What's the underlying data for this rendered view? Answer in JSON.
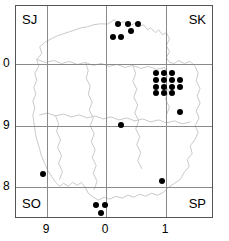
{
  "chart_data": {
    "type": "scatter",
    "title": "",
    "subtitle": "",
    "xlabel": "",
    "ylabel": "",
    "grid": true,
    "legend": null,
    "xlim": [
      8.5,
      1.85
    ],
    "ylim": [
      7.6,
      0.55
    ],
    "x_ticks": [
      {
        "label": "9",
        "value": 9
      },
      {
        "label": "0",
        "value": 0
      },
      {
        "label": "1",
        "value": 1
      }
    ],
    "y_ticks": [
      {
        "label": "0",
        "value": 0
      },
      {
        "label": "9",
        "value": 9
      },
      {
        "label": "8",
        "value": 8
      }
    ],
    "sheet_labels": {
      "top_left": "SJ",
      "top_right": "SK",
      "bottom_left": "SO",
      "bottom_right": "SP"
    },
    "points": [
      {
        "x": 117,
        "y": 23
      },
      {
        "x": 127,
        "y": 23
      },
      {
        "x": 137,
        "y": 23
      },
      {
        "x": 130,
        "y": 30
      },
      {
        "x": 112,
        "y": 36
      },
      {
        "x": 120,
        "y": 36
      },
      {
        "x": 155,
        "y": 72
      },
      {
        "x": 163,
        "y": 72
      },
      {
        "x": 171,
        "y": 72
      },
      {
        "x": 155,
        "y": 79
      },
      {
        "x": 163,
        "y": 79
      },
      {
        "x": 171,
        "y": 79
      },
      {
        "x": 179,
        "y": 79
      },
      {
        "x": 155,
        "y": 86
      },
      {
        "x": 163,
        "y": 86
      },
      {
        "x": 171,
        "y": 86
      },
      {
        "x": 179,
        "y": 86
      },
      {
        "x": 155,
        "y": 92
      },
      {
        "x": 163,
        "y": 92
      },
      {
        "x": 171,
        "y": 92
      },
      {
        "x": 179,
        "y": 111
      },
      {
        "x": 120,
        "y": 124
      },
      {
        "x": 42,
        "y": 173
      },
      {
        "x": 161,
        "y": 180
      },
      {
        "x": 95,
        "y": 204
      },
      {
        "x": 104,
        "y": 204
      },
      {
        "x": 100,
        "y": 212
      }
    ],
    "point_count": 27,
    "marker": {
      "shape": "circle",
      "color": "#000000",
      "size_px": 6
    },
    "colors": {
      "frame": "#555555",
      "gridline": "#8a8a8a",
      "map_outline": "#c8c8c8",
      "background": "#ffffff",
      "text": "#000000"
    }
  }
}
